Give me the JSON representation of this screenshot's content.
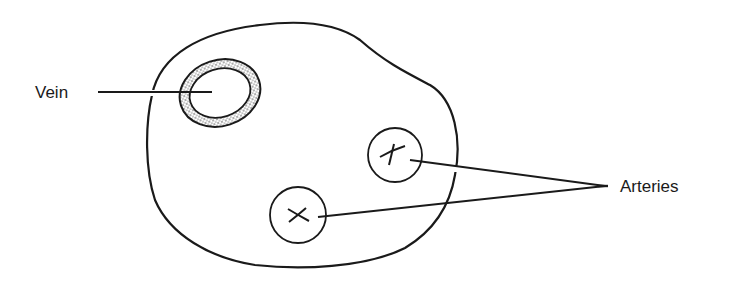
{
  "diagram": {
    "title": "",
    "labels": {
      "vein": "Vein",
      "arteries": "Arteries"
    },
    "elements": [
      {
        "name": "tissue-outline",
        "type": "irregular-blob"
      },
      {
        "name": "vein",
        "type": "stippled-thick-walled-ellipse",
        "label": "Vein"
      },
      {
        "name": "artery-1",
        "type": "circle-with-cross",
        "label": "Arteries"
      },
      {
        "name": "artery-2",
        "type": "circle-with-cross",
        "label": "Arteries"
      }
    ],
    "colors": {
      "ink": "#1a1a1a",
      "background": "#ffffff"
    }
  }
}
